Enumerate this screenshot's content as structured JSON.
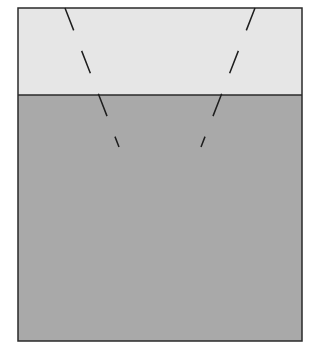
{
  "diagram": {
    "width": 319,
    "height": 360,
    "colors": {
      "background": "#ffffff",
      "upper_region": "#e6e6e6",
      "lower_region": "#a9a9a9",
      "outline": "#2a2a2a",
      "dashed_line": "#1e1e1e"
    },
    "box": {
      "x": 18,
      "y": 8,
      "width": 284,
      "height": 333
    },
    "boundary_y": 95,
    "regions": [
      {
        "name": "upper-region",
        "fill": "light gray"
      },
      {
        "name": "lower-region",
        "fill": "medium gray"
      }
    ],
    "dashed_lines": [
      {
        "name": "left-dashed-line",
        "x1": 65,
        "y1": 8,
        "x2": 119,
        "y2": 147
      },
      {
        "name": "right-dashed-line",
        "x1": 255,
        "y1": 8,
        "x2": 201,
        "y2": 147
      }
    ],
    "dash_pattern": "24 22"
  }
}
